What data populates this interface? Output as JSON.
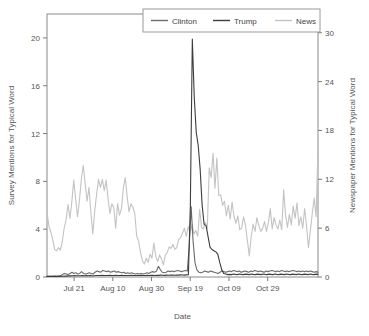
{
  "chart_data": {
    "type": "line",
    "title": "",
    "xlabel": "Date",
    "ylabel": "Survey Mentions for Typical Word",
    "y2label": "Newspaper Mentions for Typical Word",
    "grid": false,
    "legend_position": "top-right",
    "xlim": [
      0,
      140
    ],
    "ylim": [
      0,
      22
    ],
    "y2lim": [
      0,
      32.3
    ],
    "xticks": [
      {
        "value": 14,
        "label": "Jul 21"
      },
      {
        "value": 34,
        "label": "Aug 10"
      },
      {
        "value": 54,
        "label": "Aug 30"
      },
      {
        "value": 74,
        "label": "Sep 19"
      },
      {
        "value": 94,
        "label": "Oct 09"
      },
      {
        "value": 114,
        "label": "Oct 29"
      }
    ],
    "yticks": [
      {
        "value": 0,
        "label": "0"
      },
      {
        "value": 4,
        "label": "4"
      },
      {
        "value": 8,
        "label": "8"
      },
      {
        "value": 12,
        "label": "12"
      },
      {
        "value": 16,
        "label": "16"
      },
      {
        "value": 20,
        "label": "20"
      }
    ],
    "y2ticks": [
      {
        "value": 0,
        "label": "0"
      },
      {
        "value": 6,
        "label": "6"
      },
      {
        "value": 12,
        "label": "12"
      },
      {
        "value": 18,
        "label": "18"
      },
      {
        "value": 24,
        "label": "24"
      },
      {
        "value": 30,
        "label": "30"
      }
    ],
    "legend": [
      {
        "name": "Clinton",
        "color": "#6b6b6b"
      },
      {
        "name": "Trump",
        "color": "#3d3d3d"
      },
      {
        "name": "News",
        "color": "#c3c3c3"
      }
    ],
    "series": [
      {
        "name": "News",
        "axis": "right",
        "color": "#c3c3c3",
        "values": [
          8.0,
          6.2,
          5.5,
          4.6,
          3.4,
          3.2,
          3.6,
          3.3,
          4.3,
          6.0,
          7.0,
          8.9,
          7.2,
          9.2,
          11.9,
          9.6,
          7.4,
          9.4,
          12.0,
          13.7,
          11.5,
          9.3,
          11.0,
          7.9,
          5.3,
          8.1,
          10.2,
          12.0,
          11.0,
          12.0,
          10.6,
          11.9,
          9.6,
          7.8,
          9.0,
          8.5,
          6.0,
          9.0,
          7.6,
          8.4,
          10.9,
          12.2,
          9.9,
          8.0,
          9.0,
          8.6,
          7.8,
          5.0,
          4.4,
          3.0,
          2.0,
          1.6,
          2.3,
          1.8,
          2.8,
          2.3,
          4.2,
          2.5,
          1.9,
          2.7,
          2.2,
          1.5,
          2.7,
          3.0,
          3.7,
          3.5,
          4.0,
          3.4,
          3.6,
          4.6,
          4.8,
          5.4,
          6.0,
          5.0,
          6.2,
          5.4,
          6.4,
          5.3,
          5.7,
          5.0,
          8.3,
          6.1,
          5.9,
          6.7,
          6.0,
          13.4,
          12.2,
          15.2,
          10.9,
          14.6,
          10.0,
          10.1,
          8.8,
          9.3,
          7.5,
          8.8,
          7.1,
          9.2,
          7.4,
          6.6,
          7.5,
          5.8,
          6.0,
          7.4,
          6.3,
          4.5,
          2.6,
          5.0,
          6.5,
          5.6,
          7.3,
          6.3,
          5.6,
          6.0,
          6.8,
          5.6,
          6.7,
          8.4,
          5.9,
          7.3,
          6.4,
          5.9,
          7.0,
          5.8,
          10.7,
          7.6,
          6.1,
          7.7,
          6.4,
          8.7,
          7.2,
          9.1,
          6.3,
          7.4,
          6.0,
          8.4,
          6.3,
          3.6,
          5.7,
          7.8,
          9.7,
          7.4,
          16.0
        ]
      },
      {
        "name": "Clinton",
        "axis": "left",
        "color": "#6b6b6b",
        "values": [
          0.05,
          0.05,
          0.06,
          0.05,
          0.07,
          0.06,
          0.08,
          0.1,
          0.2,
          0.3,
          0.25,
          0.2,
          0.3,
          0.4,
          0.3,
          0.35,
          0.25,
          0.3,
          0.45,
          0.3,
          0.25,
          0.3,
          0.35,
          0.3,
          0.25,
          0.4,
          0.5,
          0.45,
          0.4,
          0.55,
          0.5,
          0.45,
          0.5,
          0.4,
          0.45,
          0.5,
          0.4,
          0.45,
          0.4,
          0.35,
          0.4,
          0.3,
          0.35,
          0.3,
          0.35,
          0.3,
          0.25,
          0.3,
          0.25,
          0.3,
          0.25,
          0.3,
          0.35,
          0.3,
          0.4,
          0.45,
          0.4,
          0.5,
          0.9,
          0.6,
          0.4,
          0.35,
          0.4,
          0.5,
          0.45,
          0.5,
          0.45,
          0.5,
          0.55,
          0.5,
          0.45,
          0.5,
          0.55,
          0.5,
          2.6,
          5.9,
          3.0,
          1.2,
          0.6,
          0.4,
          0.35,
          0.4,
          0.5,
          0.45,
          0.4,
          0.5,
          0.45,
          0.4,
          0.35,
          0.3,
          0.4,
          0.5,
          0.45,
          0.4,
          0.45,
          0.5,
          0.45,
          0.55,
          0.5,
          0.45,
          0.5,
          0.4,
          0.45,
          0.5,
          0.45,
          0.4,
          0.5,
          0.45,
          0.55,
          0.5,
          0.45,
          0.5,
          0.45,
          0.4,
          0.5,
          0.45,
          0.5,
          0.55,
          0.5,
          0.45,
          0.5,
          0.45,
          0.55,
          0.5,
          0.45,
          0.5,
          0.45,
          0.5,
          0.55,
          0.5,
          0.45,
          0.5,
          0.45,
          0.5,
          0.45,
          0.5,
          0.45,
          0.5,
          0.45,
          0.4,
          0.45,
          0.4
        ]
      },
      {
        "name": "Trump",
        "axis": "left",
        "color": "#3d3d3d",
        "values": [
          0.05,
          0.05,
          0.05,
          0.06,
          0.05,
          0.06,
          0.05,
          0.07,
          0.06,
          0.08,
          0.07,
          0.1,
          0.09,
          0.1,
          0.12,
          0.1,
          0.11,
          0.1,
          0.12,
          0.1,
          0.12,
          0.1,
          0.12,
          0.1,
          0.11,
          0.12,
          0.13,
          0.12,
          0.14,
          0.12,
          0.13,
          0.12,
          0.14,
          0.13,
          0.12,
          0.14,
          0.13,
          0.12,
          0.14,
          0.13,
          0.12,
          0.13,
          0.12,
          0.14,
          0.13,
          0.12,
          0.13,
          0.12,
          0.14,
          0.13,
          0.12,
          0.14,
          0.13,
          0.15,
          0.14,
          0.13,
          0.15,
          0.14,
          0.16,
          0.15,
          0.14,
          0.16,
          0.15,
          0.17,
          0.16,
          0.15,
          0.17,
          0.16,
          0.18,
          0.17,
          0.16,
          0.18,
          0.2,
          6.0,
          19.9,
          15.0,
          12.1,
          11.0,
          9.0,
          6.0,
          4.4,
          4.3,
          3.4,
          2.5,
          2.3,
          2.2,
          2.1,
          1.9,
          1.2,
          0.6,
          0.3,
          0.25,
          0.2,
          0.22,
          0.2,
          0.25,
          0.22,
          0.2,
          0.25,
          0.22,
          0.2,
          0.24,
          0.22,
          0.2,
          0.25,
          0.22,
          0.2,
          0.24,
          0.22,
          0.2,
          0.25,
          0.22,
          0.2,
          0.24,
          0.22,
          0.2,
          0.25,
          0.22,
          0.2,
          0.24,
          0.22,
          0.2,
          0.25,
          0.22,
          0.2,
          0.24,
          0.22,
          0.2,
          0.25,
          0.22,
          0.2,
          0.24,
          0.22,
          0.2,
          0.25,
          0.22,
          0.2,
          0.24,
          0.22
        ]
      }
    ]
  }
}
